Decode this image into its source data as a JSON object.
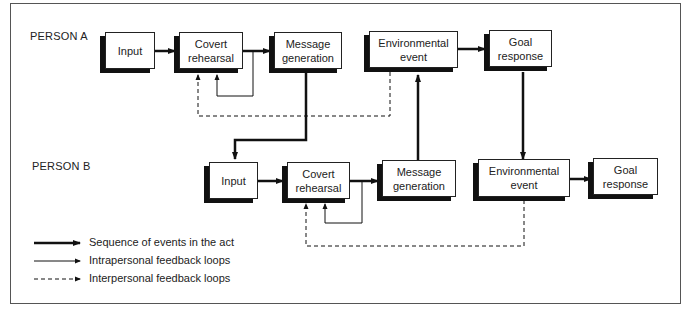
{
  "diagram": {
    "persons": [
      {
        "label": "PERSON A",
        "boxes": [
          {
            "id": "a-input",
            "label": "Input"
          },
          {
            "id": "a-covert",
            "label": "Covert\nrehearsal"
          },
          {
            "id": "a-message",
            "label": "Message\ngeneration"
          },
          {
            "id": "a-env",
            "label": "Environmental\nevent"
          },
          {
            "id": "a-goal",
            "label": "Goal\nresponse"
          }
        ]
      },
      {
        "label": "PERSON B",
        "boxes": [
          {
            "id": "b-input",
            "label": "Input"
          },
          {
            "id": "b-covert",
            "label": "Covert\nrehearsal"
          },
          {
            "id": "b-message",
            "label": "Message\ngeneration"
          },
          {
            "id": "b-env",
            "label": "Environmental\nevent"
          },
          {
            "id": "b-goal",
            "label": "Goal\nresponse"
          }
        ]
      }
    ],
    "edges": [
      {
        "from": "a-input",
        "to": "a-covert",
        "type": "sequence"
      },
      {
        "from": "a-covert",
        "to": "a-message",
        "type": "sequence"
      },
      {
        "from": "a-covert",
        "to": "a-covert",
        "type": "intrapersonal"
      },
      {
        "from": "a-env",
        "to": "a-covert",
        "type": "interpersonal"
      },
      {
        "from": "a-env",
        "to": "a-goal",
        "type": "sequence"
      },
      {
        "from": "a-message",
        "to": "b-input",
        "type": "sequence"
      },
      {
        "from": "b-message",
        "to": "a-env",
        "type": "sequence"
      },
      {
        "from": "a-goal",
        "to": "b-env",
        "type": "sequence"
      },
      {
        "from": "b-input",
        "to": "b-covert",
        "type": "sequence"
      },
      {
        "from": "b-covert",
        "to": "b-message",
        "type": "sequence"
      },
      {
        "from": "b-covert",
        "to": "b-covert",
        "type": "intrapersonal"
      },
      {
        "from": "b-env",
        "to": "b-covert",
        "type": "interpersonal"
      },
      {
        "from": "b-env",
        "to": "b-goal",
        "type": "sequence"
      }
    ],
    "legend": [
      {
        "style": "thick-solid",
        "label": "Sequence of events in the act"
      },
      {
        "style": "thin-solid",
        "label": "Intrapersonal feedback loops"
      },
      {
        "style": "dashed",
        "label": "Interpersonal feedback loops"
      }
    ],
    "colors": {
      "line": "#111111",
      "border": "#555555",
      "background": "#ffffff"
    }
  }
}
